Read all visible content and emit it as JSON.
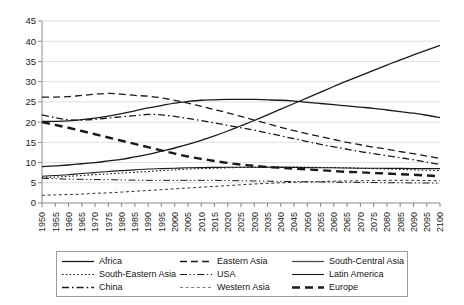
{
  "chart_data": {
    "type": "line",
    "title": "",
    "subtitle": "",
    "xlabel": "",
    "ylabel": "",
    "xlim": [
      1950,
      2100
    ],
    "ylim": [
      0,
      45
    ],
    "ytick_step": 5,
    "grid": true,
    "legend_position": "bottom",
    "legend_columns": 3,
    "x": [
      1950,
      1955,
      1960,
      1965,
      1970,
      1975,
      1980,
      1985,
      1990,
      1995,
      2000,
      2005,
      2010,
      2015,
      2020,
      2025,
      2030,
      2035,
      2040,
      2045,
      2050,
      2055,
      2060,
      2065,
      2070,
      2075,
      2080,
      2085,
      2090,
      2095,
      2100
    ],
    "xtick_labels": [
      "1950",
      "1955",
      "1960",
      "1965",
      "1970",
      "1975",
      "1980",
      "1985",
      "1990",
      "1995",
      "2000",
      "2005",
      "2010",
      "2015",
      "2020",
      "2025",
      "2030",
      "2035",
      "2040",
      "2045",
      "2050",
      "2055",
      "2060",
      "2065",
      "2070",
      "2075",
      "2080",
      "2085",
      "2090",
      "2095",
      "2100"
    ],
    "ytick_labels": [
      "0",
      "5",
      "10",
      "15",
      "20",
      "25",
      "30",
      "35",
      "40",
      "45"
    ],
    "series": [
      {
        "name": "Africa",
        "style": "solid",
        "width": 1.3,
        "color": "#1a1a1a",
        "values": [
          9.0,
          9.2,
          9.4,
          9.7,
          10.0,
          10.4,
          10.8,
          11.4,
          12.0,
          12.8,
          13.6,
          14.5,
          15.5,
          16.6,
          17.8,
          19.1,
          20.4,
          21.8,
          23.2,
          24.6,
          26.0,
          27.4,
          28.8,
          30.2,
          31.5,
          32.8,
          34.1,
          35.4,
          36.6,
          37.8,
          39.0
        ]
      },
      {
        "name": "South-Eastern Asia",
        "style": "dotted",
        "width": 1.1,
        "color": "#1a1a1a",
        "values": [
          6.3,
          6.4,
          6.6,
          6.8,
          7.0,
          7.2,
          7.4,
          7.6,
          7.8,
          8.0,
          8.2,
          8.4,
          8.5,
          8.6,
          8.7,
          8.8,
          8.85,
          8.9,
          8.9,
          8.88,
          8.85,
          8.8,
          8.75,
          8.7,
          8.6,
          8.5,
          8.4,
          8.3,
          8.2,
          8.1,
          8.0
        ]
      },
      {
        "name": "China",
        "style": "dashdot",
        "width": 1.3,
        "color": "#1a1a1a",
        "values": [
          21.8,
          21.1,
          20.6,
          20.5,
          20.7,
          21.0,
          21.3,
          21.6,
          21.9,
          21.8,
          21.4,
          20.9,
          20.4,
          19.8,
          19.2,
          18.6,
          18.0,
          17.3,
          16.6,
          15.9,
          15.2,
          14.5,
          13.9,
          13.3,
          12.7,
          12.2,
          11.7,
          11.2,
          10.7,
          10.1,
          9.5
        ]
      },
      {
        "name": "Eastern Asia",
        "style": "dashed",
        "width": 1.3,
        "color": "#1a1a1a",
        "values": [
          26.2,
          26.2,
          26.3,
          26.6,
          26.9,
          27.1,
          26.9,
          26.6,
          26.4,
          26.0,
          25.4,
          24.7,
          23.9,
          23.1,
          22.3,
          21.4,
          20.5,
          19.6,
          18.7,
          17.9,
          17.1,
          16.4,
          15.7,
          15.0,
          14.4,
          13.8,
          13.3,
          12.7,
          12.2,
          11.6,
          11.0
        ]
      },
      {
        "name": "USA",
        "style": "dashdotdot",
        "width": 1.0,
        "color": "#1a1a1a",
        "values": [
          6.1,
          6.0,
          5.9,
          5.85,
          5.8,
          5.75,
          5.7,
          5.65,
          5.6,
          5.6,
          5.6,
          5.6,
          5.6,
          5.6,
          5.55,
          5.5,
          5.45,
          5.4,
          5.35,
          5.3,
          5.25,
          5.2,
          5.15,
          5.1,
          5.1,
          5.05,
          5.0,
          5.0,
          4.95,
          4.95,
          4.9
        ]
      },
      {
        "name": "Western Asia",
        "style": "fine-dashed",
        "width": 0.9,
        "color": "#6e6e6e",
        "values": [
          1.9,
          2.0,
          2.1,
          2.2,
          2.4,
          2.5,
          2.7,
          2.9,
          3.1,
          3.3,
          3.5,
          3.7,
          3.9,
          4.1,
          4.3,
          4.5,
          4.7,
          4.85,
          5.0,
          5.1,
          5.2,
          5.3,
          5.4,
          5.45,
          5.5,
          5.55,
          5.6,
          5.6,
          5.6,
          5.55,
          5.5
        ]
      },
      {
        "name": "South-Central Asia",
        "style": "solid",
        "width": 1.3,
        "color": "#4d4d4d",
        "values": [
          20.2,
          20.2,
          20.3,
          20.6,
          21.0,
          21.5,
          22.1,
          22.8,
          23.5,
          24.1,
          24.7,
          25.1,
          25.4,
          25.5,
          25.6,
          25.6,
          25.6,
          25.5,
          25.4,
          25.2,
          24.9,
          24.6,
          24.3,
          24.0,
          23.7,
          23.4,
          23.0,
          22.6,
          22.2,
          21.7,
          21.1
        ]
      },
      {
        "name": "Latin America",
        "style": "solid",
        "width": 1.1,
        "color": "#1a1a1a",
        "values": [
          6.6,
          6.8,
          7.0,
          7.3,
          7.5,
          7.8,
          8.0,
          8.2,
          8.4,
          8.5,
          8.6,
          8.7,
          8.75,
          8.8,
          8.85,
          8.85,
          8.85,
          8.85,
          8.8,
          8.8,
          8.75,
          8.7,
          8.7,
          8.65,
          8.6,
          8.6,
          8.55,
          8.55,
          8.5,
          8.5,
          8.5
        ]
      },
      {
        "name": "Europe",
        "style": "thick-dashed",
        "width": 2.4,
        "color": "#1a1a1a",
        "values": [
          20.0,
          19.3,
          18.6,
          17.8,
          17.0,
          16.2,
          15.4,
          14.6,
          13.8,
          13.0,
          12.2,
          11.5,
          10.9,
          10.4,
          9.9,
          9.5,
          9.2,
          8.9,
          8.7,
          8.5,
          8.3,
          8.1,
          7.9,
          7.7,
          7.6,
          7.4,
          7.3,
          7.1,
          7.0,
          6.8,
          6.6
        ]
      }
    ]
  },
  "legend": {
    "items": [
      {
        "label": "Africa",
        "style": "solid"
      },
      {
        "label": "Eastern Asia",
        "style": "dashed"
      },
      {
        "label": "South-Central Asia",
        "style": "solid"
      },
      {
        "label": "South-Eastern Asia",
        "style": "dotted"
      },
      {
        "label": "USA",
        "style": "dashdotdot"
      },
      {
        "label": "Latin America",
        "style": "solid"
      },
      {
        "label": "China",
        "style": "dashdot"
      },
      {
        "label": "Western Asia",
        "style": "fine-dashed"
      },
      {
        "label": "Europe",
        "style": "thick-dashed"
      }
    ]
  },
  "colors": {
    "background": "#ffffff",
    "ink": "#1a1a1a",
    "grid": "#d2d2d2",
    "axis": "#8c8c8c",
    "legend_border": "#9a9a9a"
  }
}
